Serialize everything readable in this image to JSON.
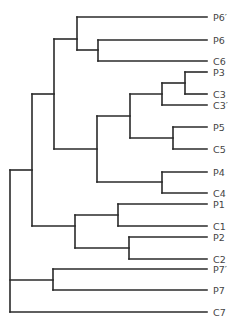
{
  "diagram": {
    "type": "dendrogram",
    "orientation": "left-to-right",
    "leaves": [
      {
        "label": "P6′",
        "y": 17
      },
      {
        "label": "P6",
        "y": 40
      },
      {
        "label": "C6",
        "y": 61
      },
      {
        "label": "P3",
        "y": 72
      },
      {
        "label": "C3",
        "y": 94
      },
      {
        "label": "C3′",
        "y": 105
      },
      {
        "label": "P5",
        "y": 127
      },
      {
        "label": "C5",
        "y": 149
      },
      {
        "label": "P4",
        "y": 172
      },
      {
        "label": "C4",
        "y": 193
      },
      {
        "label": "P1",
        "y": 204
      },
      {
        "label": "C1",
        "y": 226
      },
      {
        "label": "P2",
        "y": 237
      },
      {
        "label": "C2",
        "y": 259
      },
      {
        "label": "P7′",
        "y": 269
      },
      {
        "label": "P7",
        "y": 290
      },
      {
        "label": "C7",
        "y": 312
      }
    ],
    "leaf_x": 207,
    "label_x": 213,
    "nodes": [
      {
        "name": "P6-C6",
        "x": 98,
        "y1": 40,
        "y2": 61,
        "parent_x": 77
      },
      {
        "name": "P6prime-P6C6",
        "x": 77,
        "y1": 17,
        "y2": 50,
        "parent_x": 54
      },
      {
        "name": "P3-C3",
        "x": 185,
        "y1": 72,
        "y2": 94,
        "parent_x": 162
      },
      {
        "name": "P3C3-C3prime",
        "x": 162,
        "y1": 83,
        "y2": 105,
        "parent_x": 130
      },
      {
        "name": "P5-C5",
        "x": 173,
        "y1": 127,
        "y2": 149,
        "parent_x": 130
      },
      {
        "name": "C3grp-P5C5",
        "x": 130,
        "y1": 94,
        "y2": 138,
        "parent_x": 97
      },
      {
        "name": "P4-C4",
        "x": 162,
        "y1": 172,
        "y2": 193,
        "parent_x": 97
      },
      {
        "name": "mid-cluster",
        "x": 97,
        "y1": 116,
        "y2": 182,
        "parent_x": 54
      },
      {
        "name": "upper-cluster",
        "x": 54,
        "y1": 39,
        "y2": 149,
        "parent_x": 32
      },
      {
        "name": "P1-C1",
        "x": 118,
        "y1": 204,
        "y2": 226,
        "parent_x": 75
      },
      {
        "name": "P2-C2",
        "x": 129,
        "y1": 237,
        "y2": 259,
        "parent_x": 75
      },
      {
        "name": "P1C1-P2C2",
        "x": 75,
        "y1": 215,
        "y2": 248,
        "parent_x": 32
      },
      {
        "name": "upper-lower",
        "x": 32,
        "y1": 94,
        "y2": 226,
        "parent_x": 10
      },
      {
        "name": "P7prime-P7",
        "x": 53,
        "y1": 269,
        "y2": 290,
        "parent_x": 10
      },
      {
        "name": "root",
        "x": 10,
        "y1": 170,
        "y2": 312,
        "parent_x": null
      }
    ],
    "edges": [
      {
        "from_x": 77,
        "to_x": 207,
        "y": 17
      },
      {
        "from_x": 98,
        "to_x": 207,
        "y": 40
      },
      {
        "from_x": 98,
        "to_x": 207,
        "y": 61
      },
      {
        "from_x": 77,
        "to_x": 98,
        "y": 50
      },
      {
        "from_x": 54,
        "to_x": 77,
        "y": 39
      },
      {
        "from_x": 185,
        "to_x": 207,
        "y": 72
      },
      {
        "from_x": 185,
        "to_x": 207,
        "y": 94
      },
      {
        "from_x": 162,
        "to_x": 185,
        "y": 83
      },
      {
        "from_x": 162,
        "to_x": 207,
        "y": 105
      },
      {
        "from_x": 130,
        "to_x": 162,
        "y": 94
      },
      {
        "from_x": 173,
        "to_x": 207,
        "y": 127
      },
      {
        "from_x": 173,
        "to_x": 207,
        "y": 149
      },
      {
        "from_x": 130,
        "to_x": 173,
        "y": 138
      },
      {
        "from_x": 97,
        "to_x": 130,
        "y": 116
      },
      {
        "from_x": 162,
        "to_x": 207,
        "y": 172
      },
      {
        "from_x": 162,
        "to_x": 207,
        "y": 193
      },
      {
        "from_x": 97,
        "to_x": 162,
        "y": 182
      },
      {
        "from_x": 54,
        "to_x": 97,
        "y": 149
      },
      {
        "from_x": 32,
        "to_x": 54,
        "y": 94
      },
      {
        "from_x": 118,
        "to_x": 207,
        "y": 204
      },
      {
        "from_x": 118,
        "to_x": 207,
        "y": 226
      },
      {
        "from_x": 75,
        "to_x": 118,
        "y": 215
      },
      {
        "from_x": 129,
        "to_x": 207,
        "y": 237
      },
      {
        "from_x": 129,
        "to_x": 207,
        "y": 259
      },
      {
        "from_x": 75,
        "to_x": 129,
        "y": 248
      },
      {
        "from_x": 32,
        "to_x": 75,
        "y": 226
      },
      {
        "from_x": 10,
        "to_x": 32,
        "y": 170
      },
      {
        "from_x": 53,
        "to_x": 207,
        "y": 269
      },
      {
        "from_x": 53,
        "to_x": 207,
        "y": 290
      },
      {
        "from_x": 10,
        "to_x": 53,
        "y": 280
      },
      {
        "from_x": 10,
        "to_x": 207,
        "y": 312
      }
    ]
  }
}
